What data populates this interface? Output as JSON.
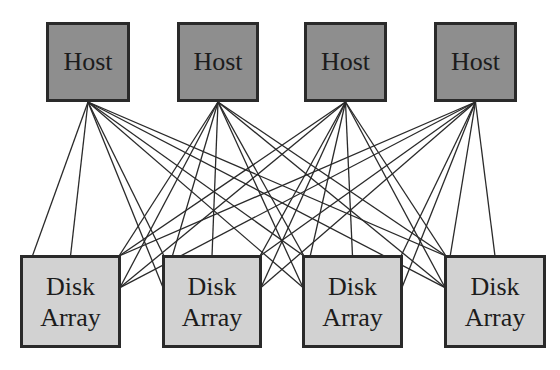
{
  "diagram": {
    "type": "full-mesh-connection",
    "colors": {
      "host_fill": "#8e8e8e",
      "disk_fill": "#d2d2d2",
      "border": "#2a2a2a",
      "line": "#2a2a2a",
      "background": "#ffffff"
    },
    "hosts": [
      {
        "label": "Host",
        "x": 46,
        "y": 22,
        "w": 84,
        "h": 80
      },
      {
        "label": "Host",
        "x": 177,
        "y": 22,
        "w": 82,
        "h": 80
      },
      {
        "label": "Host",
        "x": 304,
        "y": 22,
        "w": 83,
        "h": 80
      },
      {
        "label": "Host",
        "x": 434,
        "y": 22,
        "w": 83,
        "h": 80
      }
    ],
    "disk_arrays": [
      {
        "label": "Disk\nArray",
        "x": 20,
        "y": 255,
        "w": 101,
        "h": 93
      },
      {
        "label": "Disk\nArray",
        "x": 162,
        "y": 255,
        "w": 100,
        "h": 93
      },
      {
        "label": "Disk\nArray",
        "x": 302,
        "y": 255,
        "w": 101,
        "h": 93
      },
      {
        "label": "Disk\nArray",
        "x": 444,
        "y": 255,
        "w": 102,
        "h": 93
      }
    ],
    "connection_points_per_disk": [
      "left-mid",
      "top-left",
      "top-center",
      "top-right",
      "right-mid"
    ],
    "note": "Every host connects to every disk array via multiple paths"
  }
}
